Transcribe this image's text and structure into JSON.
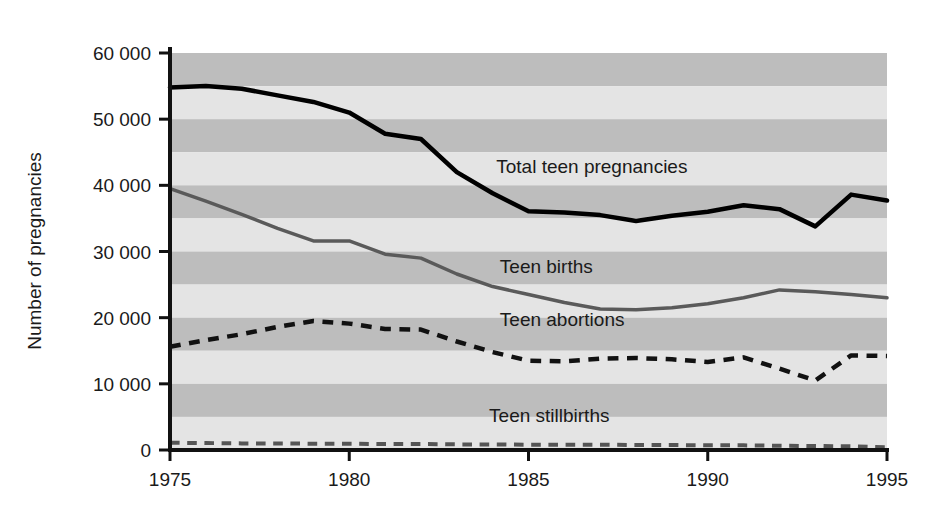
{
  "chart_data": {
    "type": "line",
    "title": "",
    "xlabel": "",
    "ylabel": "Number of pregnancies",
    "xlim": [
      1975,
      1995
    ],
    "ylim": [
      0,
      60000
    ],
    "grid": "horizontal-bands",
    "legend_position": "inline-annotations",
    "x": [
      1975,
      1976,
      1977,
      1978,
      1979,
      1980,
      1981,
      1982,
      1983,
      1984,
      1985,
      1986,
      1987,
      1988,
      1989,
      1990,
      1991,
      1992,
      1993,
      1994,
      1995
    ],
    "xticks": [
      "1975",
      "1980",
      "1985",
      "1990",
      "1995"
    ],
    "xtick_values": [
      1975,
      1980,
      1985,
      1990,
      1995
    ],
    "yticks": [
      "0",
      "10 000",
      "20 000",
      "30 000",
      "40 000",
      "50 000",
      "60 000"
    ],
    "ytick_values": [
      0,
      10000,
      20000,
      30000,
      40000,
      50000,
      60000
    ],
    "band_interval": 5000,
    "series": [
      {
        "name": "Total teen pregnancies",
        "style": "solid",
        "color": "#000000",
        "width": 4.5,
        "label_x": 1984.1,
        "label_y": 41800,
        "values": [
          54800,
          55000,
          54600,
          53600,
          52600,
          51000,
          47800,
          47000,
          42000,
          38800,
          36100,
          35900,
          35500,
          34600,
          35400,
          36000,
          37000,
          36400,
          33800,
          38600,
          37700
        ]
      },
      {
        "name": "Teen births",
        "style": "solid",
        "color": "#5a5a5a",
        "width": 3.5,
        "label_x": 1984.2,
        "label_y": 26800,
        "values": [
          39500,
          37600,
          35600,
          33500,
          31600,
          31600,
          29600,
          29000,
          26600,
          24700,
          23500,
          22300,
          21300,
          21200,
          21500,
          22100,
          23000,
          24200,
          23900,
          23500,
          23000
        ]
      },
      {
        "name": "Teen abortions",
        "style": "dashed",
        "color": "#111111",
        "width": 4.5,
        "label_x": 1984.2,
        "label_y": 18700,
        "values": [
          15600,
          16600,
          17500,
          18600,
          19500,
          19100,
          18300,
          18200,
          16400,
          14800,
          13500,
          13400,
          13800,
          13900,
          13700,
          13300,
          14000,
          12300,
          10500,
          14300,
          14200
        ]
      },
      {
        "name": "Teen stillbirths",
        "style": "dashed",
        "color": "#555555",
        "width": 4.0,
        "label_x": 1983.9,
        "label_y": 4200,
        "values": [
          1100,
          1050,
          1000,
          1000,
          950,
          950,
          900,
          900,
          850,
          850,
          800,
          800,
          800,
          750,
          750,
          700,
          700,
          650,
          600,
          550,
          400
        ]
      }
    ]
  },
  "colors": {
    "band_dark": "#bdbdbd",
    "band_light": "#e4e4e4",
    "axis": "#111111",
    "text": "#1a1a1a",
    "background": "#ffffff"
  }
}
